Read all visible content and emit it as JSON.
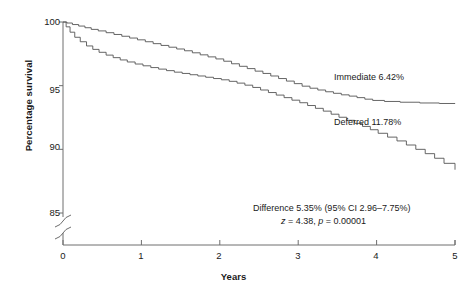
{
  "chart_data": {
    "type": "line",
    "title": "",
    "xlabel": "Years",
    "ylabel": "Percentage survival",
    "xlim": [
      0,
      5
    ],
    "ylim": [
      85,
      100
    ],
    "y_axis_break": true,
    "y_break_note": "axis broken between 85 and 0",
    "grid": false,
    "legend": "inline-labels",
    "xticks": [
      "0",
      "1",
      "2",
      "3",
      "4",
      "5"
    ],
    "yticks": [
      "100",
      "95",
      "90",
      "85"
    ],
    "series": [
      {
        "name": "Immediate",
        "label": "Immediate 6.42%",
        "final_event_rate_percent": 6.42,
        "x": [
          0.0,
          0.05,
          0.12,
          0.2,
          0.28,
          0.36,
          0.45,
          0.55,
          0.65,
          0.75,
          0.85,
          0.95,
          1.05,
          1.15,
          1.25,
          1.35,
          1.45,
          1.55,
          1.65,
          1.75,
          1.85,
          1.95,
          2.05,
          2.15,
          2.25,
          2.35,
          2.45,
          2.55,
          2.65,
          2.75,
          2.85,
          2.95,
          3.05,
          3.15,
          3.25,
          3.35,
          3.45,
          3.55,
          3.65,
          3.75,
          3.85,
          3.95,
          4.1,
          4.3,
          4.55,
          4.8,
          5.0
        ],
        "y": [
          100.0,
          99.92,
          99.8,
          99.68,
          99.55,
          99.42,
          99.3,
          99.16,
          99.02,
          98.88,
          98.74,
          98.6,
          98.45,
          98.3,
          98.16,
          98.02,
          97.88,
          97.74,
          97.58,
          97.42,
          97.26,
          97.1,
          96.92,
          96.72,
          96.52,
          96.34,
          96.14,
          95.96,
          95.76,
          95.56,
          95.36,
          95.16,
          94.96,
          94.8,
          94.66,
          94.52,
          94.4,
          94.28,
          94.18,
          94.06,
          93.94,
          93.84,
          93.76,
          93.7,
          93.64,
          93.6,
          93.58
        ]
      },
      {
        "name": "Deferred",
        "label": "Deferred 11.78%",
        "final_event_rate_percent": 11.78,
        "x": [
          0.0,
          0.04,
          0.09,
          0.15,
          0.22,
          0.3,
          0.38,
          0.46,
          0.55,
          0.64,
          0.73,
          0.82,
          0.92,
          1.02,
          1.12,
          1.22,
          1.32,
          1.42,
          1.52,
          1.62,
          1.72,
          1.82,
          1.92,
          2.02,
          2.12,
          2.22,
          2.32,
          2.42,
          2.52,
          2.62,
          2.72,
          2.82,
          2.92,
          3.02,
          3.12,
          3.22,
          3.32,
          3.42,
          3.52,
          3.62,
          3.72,
          3.82,
          3.92,
          4.02,
          4.14,
          4.26,
          4.38,
          4.5,
          4.62,
          4.74,
          4.86,
          5.0
        ],
        "y": [
          100.0,
          99.62,
          99.2,
          98.8,
          98.45,
          98.12,
          97.85,
          97.62,
          97.4,
          97.2,
          97.02,
          96.86,
          96.7,
          96.56,
          96.42,
          96.3,
          96.18,
          96.06,
          95.96,
          95.86,
          95.76,
          95.66,
          95.56,
          95.46,
          95.34,
          95.2,
          95.04,
          94.86,
          94.66,
          94.46,
          94.26,
          94.06,
          93.86,
          93.66,
          93.44,
          93.22,
          93.0,
          92.76,
          92.52,
          92.28,
          92.04,
          91.8,
          91.54,
          91.26,
          90.96,
          90.66,
          90.34,
          90.0,
          89.66,
          89.3,
          88.9,
          88.4
        ]
      }
    ],
    "annotations": [
      {
        "id": "difference-line-1",
        "text": "Difference 5.35% (95% CI 2.96–7.75%)"
      },
      {
        "id": "difference-line-2",
        "text": "z = 4.38, p = 0.00001"
      }
    ],
    "annotation_stats": {
      "difference_percent": 5.35,
      "ci_lower": 2.96,
      "ci_upper": 7.75,
      "ci_level": "95%",
      "z": 4.38,
      "p": "0.00001"
    },
    "colors": {
      "axis": "#6e6e6e",
      "immediate_line": "#555555",
      "deferred_line": "#555555",
      "text": "#1a1a1a",
      "background": "#ffffff"
    }
  }
}
